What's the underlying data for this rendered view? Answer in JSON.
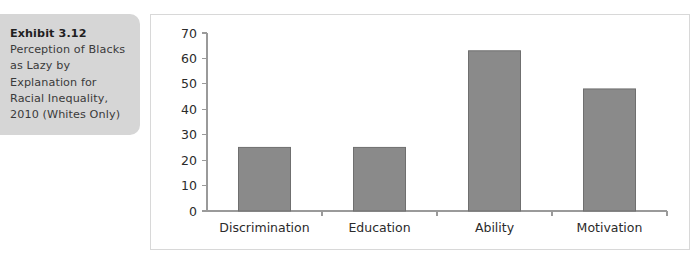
{
  "caption": {
    "lead": "Exhibit 3.12",
    "body": " Perception of Blacks as Lazy by Explanation for Racial Inequality, 2010 (Whites Only)"
  },
  "chart_data": {
    "type": "bar",
    "title": "",
    "xlabel": "",
    "ylabel": "",
    "categories": [
      "Discrimination",
      "Education",
      "Ability",
      "Motivation"
    ],
    "values": [
      25,
      25,
      63,
      48
    ],
    "ylim": [
      0,
      70
    ],
    "ytick_labels": [
      "0",
      "10",
      "20",
      "30",
      "40",
      "50",
      "60",
      "70"
    ],
    "ytick_values": [
      0,
      10,
      20,
      30,
      40,
      50,
      60,
      70
    ],
    "grid": false,
    "legend": "none",
    "bar_color": "#8a8a8a",
    "bar_border_color": "#6f6f6f",
    "axis_color": "#9a9a9a",
    "panel_background": "#ffffff",
    "panel_border_color": "#d8d8d8",
    "caption_background": "#d6d6d6"
  }
}
